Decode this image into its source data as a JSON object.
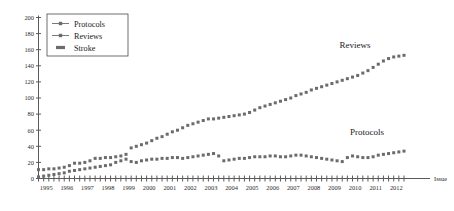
{
  "chart_data": {
    "type": "line",
    "title": "",
    "xlabel": "Issue",
    "ylabel": "",
    "ylim": [
      0,
      200
    ],
    "ytick_step": 20,
    "yticks": [
      "0",
      "20",
      "40",
      "60",
      "80",
      "100",
      "120",
      "140",
      "160",
      "180",
      "200"
    ],
    "grid": false,
    "xtick_labels": [
      "1995",
      "1996",
      "1997",
      "1998",
      "1999",
      "2000",
      "2001",
      "2002",
      "2003",
      "2004",
      "2005",
      "2006",
      "2007",
      "2008",
      "2009",
      "2010",
      "2011",
      "2012"
    ],
    "issues_per_year": 4,
    "x": [
      "1995.1",
      "1995.2",
      "1995.3",
      "1995.4",
      "1996.1",
      "1996.2",
      "1996.3",
      "1996.4",
      "1997.1",
      "1997.2",
      "1997.3",
      "1997.4",
      "1998.1",
      "1998.2",
      "1998.3",
      "1998.4",
      "1999.1",
      "1999.2",
      "1999.3",
      "1999.4",
      "2000.1",
      "2000.2",
      "2000.3",
      "2000.4",
      "2001.1",
      "2001.2",
      "2001.3",
      "2001.4",
      "2002.1",
      "2002.2",
      "2002.3",
      "2002.4",
      "2003.1",
      "2003.2",
      "2003.3",
      "2003.4",
      "2004.1",
      "2004.2",
      "2004.3",
      "2004.4",
      "2005.1",
      "2005.2",
      "2005.3",
      "2005.4",
      "2006.1",
      "2006.2",
      "2006.3",
      "2006.4",
      "2007.1",
      "2007.2",
      "2007.3",
      "2007.4",
      "2008.1",
      "2008.2",
      "2008.3",
      "2008.4",
      "2009.1",
      "2009.2",
      "2009.3",
      "2009.4",
      "2010.1",
      "2010.2",
      "2010.3",
      "2010.4",
      "2011.1",
      "2011.2",
      "2011.3",
      "2011.4",
      "2012.1",
      "2012.2",
      "2012.3",
      "2012.4"
    ],
    "series": [
      {
        "name": "Reviews",
        "marker": "square",
        "color": "#6b6b6b",
        "annotation": "Reviews",
        "values": [
          11,
          11,
          12,
          12,
          13,
          14,
          16,
          19,
          19,
          20,
          22,
          25,
          25,
          26,
          26,
          27,
          28,
          30,
          38,
          40,
          42,
          44,
          47,
          50,
          52,
          55,
          58,
          60,
          63,
          66,
          68,
          70,
          72,
          74,
          74,
          75,
          76,
          77,
          78,
          79,
          80,
          82,
          85,
          88,
          90,
          92,
          94,
          96,
          98,
          100,
          103,
          105,
          107,
          110,
          112,
          114,
          116,
          118,
          120,
          122,
          124,
          126,
          128,
          131,
          134,
          138,
          142,
          146,
          149,
          151,
          152,
          153
        ]
      },
      {
        "name": "Protocols",
        "marker": "square",
        "color": "#6b6b6b",
        "annotation": "Protocols",
        "values": [
          2,
          3,
          4,
          5,
          6,
          7,
          9,
          10,
          11,
          12,
          13,
          14,
          15,
          16,
          17,
          20,
          22,
          24,
          21,
          20,
          22,
          23,
          24,
          24,
          25,
          25,
          26,
          26,
          25,
          26,
          27,
          28,
          29,
          30,
          31,
          28,
          22,
          23,
          24,
          25,
          25,
          26,
          27,
          27,
          27,
          28,
          28,
          27,
          27,
          28,
          29,
          29,
          28,
          27,
          26,
          25,
          24,
          23,
          22,
          21,
          26,
          28,
          27,
          26,
          26,
          27,
          29,
          30,
          31,
          32,
          33,
          34
        ]
      }
    ],
    "legend": {
      "position": "top-left",
      "entries": [
        {
          "label": "Protocols",
          "style": "line-marker"
        },
        {
          "label": "Reviews",
          "style": "line-marker"
        },
        {
          "label": "Stroke",
          "style": "bar"
        }
      ]
    }
  }
}
